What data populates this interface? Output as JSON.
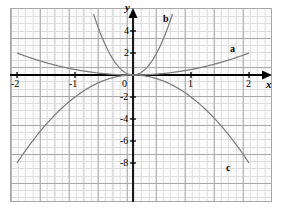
{
  "figure": {
    "background_color": "#ffffff",
    "plot_background_color": "#fbfbfb",
    "minor_grid_color": "#dedede",
    "major_grid_color": "#a8a8a8",
    "axis_color": "#000000",
    "curve_color": "#7d7d7d"
  },
  "axes": {
    "x_axis_name": "x",
    "y_axis_name": "y",
    "origin_label": "0"
  },
  "chart_data": {
    "type": "line",
    "title": "",
    "subtitle": "",
    "xlabel": "x",
    "ylabel": "y",
    "xlim": [
      -2.28,
      2.4
    ],
    "ylim": [
      -9.0,
      8.6
    ],
    "grid": true,
    "minor_grid": true,
    "legend": "inline-curve-labels",
    "x_ticks": [
      -2,
      -1,
      0,
      1,
      2
    ],
    "x_tick_labels": [
      "-2",
      "-1",
      "0",
      "1",
      "2"
    ],
    "y_ticks": [
      -8,
      -6,
      -4,
      -2,
      2,
      4
    ],
    "y_tick_labels": [
      "-8",
      "-6",
      "-4",
      "-2",
      "2",
      "4"
    ],
    "annotations": [
      {
        "text": "a",
        "x": 1.78,
        "y": 2.55
      },
      {
        "text": "b",
        "x": 0.66,
        "y": 5.2
      },
      {
        "text": "c",
        "x": 1.72,
        "y": -6.8
      }
    ],
    "series": [
      {
        "name": "a",
        "label": "a",
        "equation": "y = 0.5x^2",
        "coefficient": 0.5,
        "opens": "up",
        "x": [
          -2,
          -1.75,
          -1.5,
          -1.25,
          -1,
          -0.75,
          -0.5,
          -0.25,
          0,
          0.25,
          0.5,
          0.75,
          1,
          1.25,
          1.5,
          1.75,
          2
        ],
        "values": [
          2,
          1.531,
          1.125,
          0.781,
          0.5,
          0.281,
          0.125,
          0.031,
          0,
          0.031,
          0.125,
          0.281,
          0.5,
          0.781,
          1.125,
          1.531,
          2
        ]
      },
      {
        "name": "b",
        "label": "b",
        "equation": "y = 12x^2",
        "coefficient": 12,
        "opens": "up",
        "x": [
          -0.68,
          -0.6,
          -0.5,
          -0.4,
          -0.3,
          -0.2,
          -0.1,
          0,
          0.1,
          0.2,
          0.3,
          0.4,
          0.5,
          0.6,
          0.68
        ],
        "values": [
          5.549,
          4.32,
          3,
          1.92,
          1.08,
          0.48,
          0.12,
          0,
          0.12,
          0.48,
          1.08,
          1.92,
          3,
          4.32,
          5.549
        ]
      },
      {
        "name": "c",
        "label": "c",
        "equation": "y = -2x^2",
        "coefficient": -2,
        "opens": "down",
        "x": [
          -2,
          -1.75,
          -1.5,
          -1.25,
          -1,
          -0.75,
          -0.5,
          -0.25,
          0,
          0.25,
          0.5,
          0.75,
          1,
          1.25,
          1.5,
          1.75,
          2
        ],
        "values": [
          -8,
          -6.125,
          -4.5,
          -3.125,
          -2,
          -1.125,
          -0.5,
          -0.125,
          0,
          -0.125,
          -0.5,
          -1.125,
          -2,
          -3.125,
          -4.5,
          -6.125,
          -8
        ]
      }
    ]
  }
}
